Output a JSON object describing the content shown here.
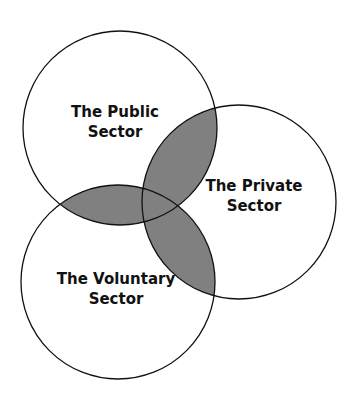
{
  "diagram": {
    "type": "venn",
    "circles": [
      {
        "id": "public",
        "line1": "The Public",
        "line2": "Sector"
      },
      {
        "id": "private",
        "line1": "The Private",
        "line2": "Sector"
      },
      {
        "id": "voluntary",
        "line1": "The Voluntary",
        "line2": "Sector"
      }
    ],
    "colors": {
      "overlap_fill": "#808080",
      "stroke": "#111111",
      "background": "#ffffff"
    }
  }
}
